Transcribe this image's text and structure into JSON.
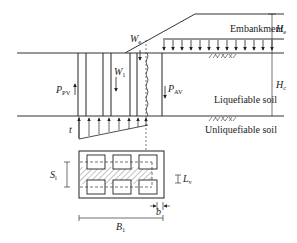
{
  "figure": {
    "type": "engineering-schematic",
    "layers": {
      "embankment": "Embankment",
      "liquefiable": "Liquefiable soil",
      "unliquefiable": "Unliquefiable soil"
    },
    "symbols": {
      "We": {
        "main": "W",
        "sub": "e"
      },
      "W1": {
        "main": "W",
        "sub": "1"
      },
      "Ppv": {
        "main": "P",
        "sub": "PV"
      },
      "Pav": {
        "main": "P",
        "sub": "AV"
      },
      "He": {
        "main": "H",
        "sub": "e"
      },
      "Hc": {
        "main": "H",
        "sub": "c"
      },
      "t": {
        "main": "t",
        "sub": ""
      },
      "Si": {
        "main": "S",
        "sub": "i"
      },
      "Lv": {
        "main": "L",
        "sub": "v"
      },
      "b": {
        "main": "b",
        "sub": ""
      },
      "B1": {
        "main": "B",
        "sub": "1"
      }
    },
    "colors": {
      "line": "#333333",
      "hatch": "#555555",
      "background": "#ffffff"
    }
  }
}
